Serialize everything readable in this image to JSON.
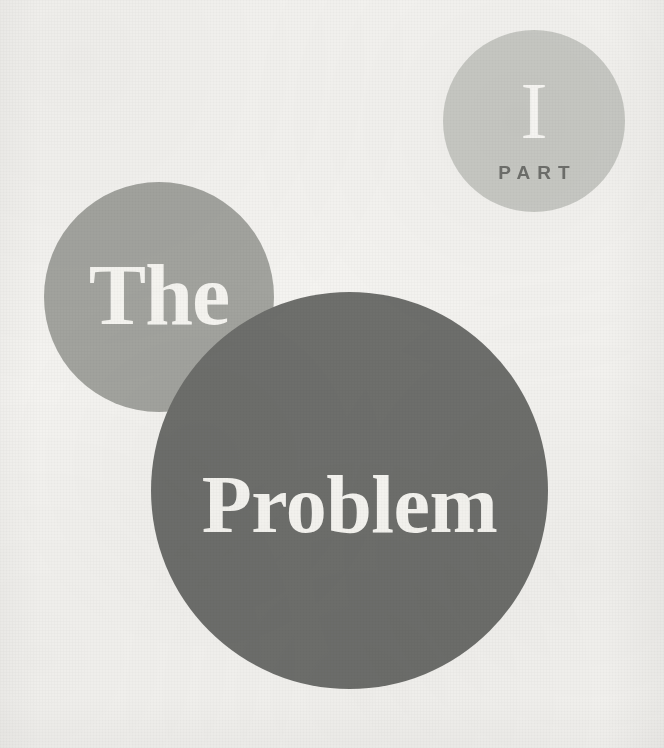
{
  "page": {
    "kind": "book-part-divider",
    "background_color": "#f5f4f1"
  },
  "part_badge": {
    "numeral": "I",
    "label": "PART",
    "circle_color": "#c9cac5",
    "numeral_color": "#fbfaf7",
    "label_color": "#6f706c"
  },
  "title": {
    "line1": "The",
    "line2": "Problem",
    "full_text": "The Problem",
    "line1_circle_color": "#a3a49f",
    "line2_circle_color": "#6e6f6c",
    "text_color": "#f7f6f2"
  }
}
